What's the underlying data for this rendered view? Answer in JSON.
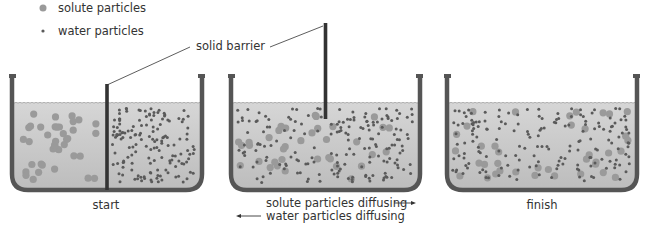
{
  "legend": {
    "solute_label": "solute particles",
    "water_label": "water particles"
  },
  "annotations": {
    "barrier_label": "solid barrier",
    "solute_diffusing": "solute particles diffusing",
    "water_diffusing": "water particles diffusing"
  },
  "stages": [
    {
      "label": "start",
      "barrier": "lowered",
      "distribution": "separated"
    },
    {
      "label": "",
      "barrier": "raised",
      "distribution": "mixing"
    },
    {
      "label": "finish",
      "barrier": "none",
      "distribution": "uniform"
    }
  ],
  "colors": {
    "solute": "#9a9a9a",
    "water": "#5a5a5a",
    "liquid": "#cfcfcf",
    "beaker": "#555555",
    "barrier": "#333333"
  }
}
